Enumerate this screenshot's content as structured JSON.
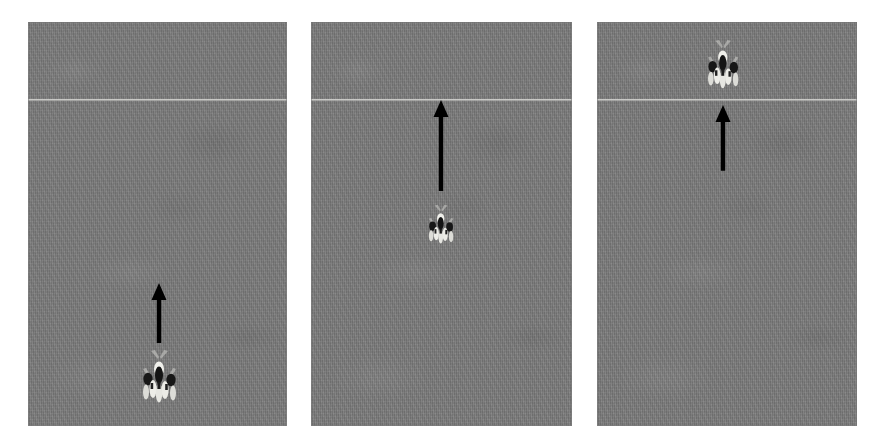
{
  "figure": {
    "title": "",
    "width": 887,
    "height": 447,
    "background_color": "#ffffff",
    "panel_count": 3
  },
  "style": {
    "ground_color": "#7a7a7a",
    "reference_line_color": "#d7d7d4",
    "arrow_color": "#000000",
    "person_dark_color": "#1a1a1a",
    "person_light_color": "#e8e8e4"
  },
  "panels": [
    {
      "id": "panel-1",
      "label": "frame-1",
      "x": 28,
      "y": 22,
      "width": 259,
      "height": 404,
      "reference_line": {
        "y_ratio": 0.19,
        "label": "crossing-line"
      },
      "crowd": {
        "cx_ratio": 0.505,
        "cy_ratio": 0.885,
        "scale": 1.0,
        "person_count": 5,
        "label": "pedestrian-group"
      },
      "arrow": {
        "cx_ratio": 0.505,
        "tail_y_ratio": 0.795,
        "head_y_ratio": 0.645,
        "direction": "up",
        "label": "motion-arrow"
      }
    },
    {
      "id": "panel-2",
      "label": "frame-2",
      "x": 311,
      "y": 22,
      "width": 261,
      "height": 404,
      "reference_line": {
        "y_ratio": 0.19,
        "label": "crossing-line"
      },
      "crowd": {
        "cx_ratio": 0.497,
        "cy_ratio": 0.508,
        "scale": 0.74,
        "person_count": 5,
        "label": "pedestrian-group"
      },
      "arrow": {
        "cx_ratio": 0.497,
        "tail_y_ratio": 0.418,
        "head_y_ratio": 0.193,
        "direction": "up",
        "label": "motion-arrow"
      }
    },
    {
      "id": "panel-3",
      "label": "frame-3",
      "x": 597,
      "y": 22,
      "width": 260,
      "height": 404,
      "reference_line": {
        "y_ratio": 0.19,
        "label": "crossing-line"
      },
      "crowd": {
        "cx_ratio": 0.483,
        "cy_ratio": 0.113,
        "scale": 0.92,
        "person_count": 5,
        "label": "pedestrian-group"
      },
      "arrow": {
        "cx_ratio": 0.483,
        "tail_y_ratio": 0.368,
        "head_y_ratio": 0.205,
        "direction": "up",
        "label": "motion-arrow"
      }
    }
  ]
}
